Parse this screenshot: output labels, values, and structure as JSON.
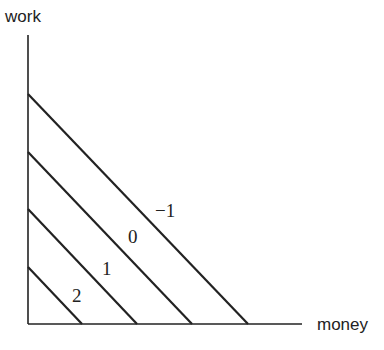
{
  "axes": {
    "y_label": "work",
    "x_label": "money"
  },
  "lines": [
    {
      "label": "2",
      "y_intercept": 267,
      "x_intercept": 82,
      "label_x": 72,
      "label_y": 302
    },
    {
      "label": "1",
      "y_intercept": 209,
      "x_intercept": 137,
      "label_x": 102,
      "label_y": 275
    },
    {
      "label": "0",
      "y_intercept": 152,
      "x_intercept": 192,
      "label_x": 128,
      "label_y": 243
    },
    {
      "label": "−1",
      "y_intercept": 94,
      "x_intercept": 248,
      "label_x": 155,
      "label_y": 217
    }
  ],
  "colors": {
    "ink": "#222222",
    "background": "#ffffff"
  }
}
